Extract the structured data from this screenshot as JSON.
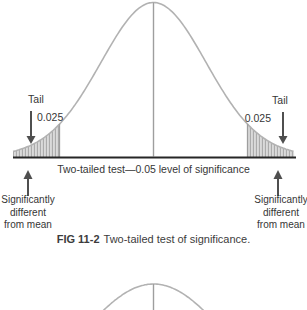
{
  "figure": {
    "tail_left": {
      "label": "Tail",
      "value": "0.025"
    },
    "tail_right": {
      "label": "Tail",
      "value": "0.025"
    },
    "axis_caption": "Two-tailed test—0.05 level of significance",
    "sig_left": {
      "lines": [
        "Significantly",
        "different",
        "from mean"
      ]
    },
    "sig_right": {
      "lines": [
        "Significantly",
        "different",
        "from mean"
      ]
    },
    "caption": {
      "label": "FIG 11-2",
      "text": "Two-tailed test of significance."
    }
  },
  "colors": {
    "curve": "#b2b2b2",
    "mean_line": "#9e9e9e",
    "baseline": "#262626",
    "arrow": "#4f4f4f",
    "text": "#363636",
    "hatch_bg": "#dadada",
    "hatch_line": "#a6a6a6",
    "boundary": "#9e9e9e"
  },
  "chart_data": {
    "type": "area",
    "xlabel": "Two-tailed test—0.05 level of significance",
    "ylabel": "",
    "curve": "normal distribution (bell curve), mean marked by central vertical line",
    "significance_level": 0.05,
    "tails": [
      {
        "side": "left",
        "label": "Tail",
        "area": 0.025,
        "annotation": "Significantly different from mean",
        "shading": "vertical hatch"
      },
      {
        "side": "right",
        "label": "Tail",
        "area": 0.025,
        "annotation": "Significantly different from mean",
        "shading": "vertical hatch"
      }
    ],
    "axes_shown": false,
    "grid": false
  }
}
